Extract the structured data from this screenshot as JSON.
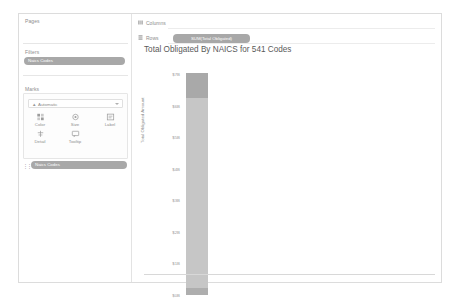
{
  "app": {
    "type": "tableau-worksheet"
  },
  "sidebar": {
    "pages": {
      "label": "Pages"
    },
    "filters": {
      "label": "Filters",
      "pills": [
        {
          "label": "Naics Codes"
        }
      ]
    },
    "marks": {
      "label": "Marks",
      "mark_type": {
        "value": "Automatic",
        "icon": "mark-type-icon",
        "caret": "chevron-down-icon"
      },
      "buttons": [
        {
          "label": "Color",
          "icon": "color-icon"
        },
        {
          "label": "Size",
          "icon": "size-icon"
        },
        {
          "label": "Label",
          "icon": "label-icon"
        },
        {
          "label": "Detail",
          "icon": "detail-icon"
        },
        {
          "label": "Tooltip",
          "icon": "tooltip-icon"
        }
      ],
      "pills": [
        {
          "label": "Naics Codes",
          "grip": "grip-icon"
        }
      ]
    }
  },
  "shelves": {
    "columns": {
      "label": "Columns",
      "icon": "columns-icon",
      "pills": []
    },
    "rows": {
      "label": "Rows",
      "icon": "rows-icon",
      "pills": [
        {
          "label": "SUM(Total Obligated)"
        }
      ]
    }
  },
  "chart_data": {
    "type": "bar",
    "title": "Total Obligated By NAICS for 541 Codes",
    "xlabel": "",
    "ylabel": "Total Obligated Amount",
    "grid": false,
    "legend": null,
    "categories": [
      "Naics Codes"
    ],
    "ytick_labels": [
      "$0B",
      "$1B",
      "$2B",
      "$3B",
      "$4B",
      "$5B",
      "$6B",
      "$7B"
    ],
    "ytick_values": [
      0,
      1,
      2,
      3,
      4,
      5,
      6,
      7
    ],
    "ylim": [
      0,
      7.4
    ],
    "series": [
      {
        "name": "SUM(Total Obligated)",
        "values": [
          7.05
        ],
        "color": "#c4c4c4"
      }
    ],
    "stack_segments": [
      {
        "name": "top-segment",
        "from": 6.25,
        "to": 7.05,
        "color": "#a9a9a9"
      },
      {
        "name": "body-segment",
        "from": 0.22,
        "to": 6.25,
        "color": "#c6c6c6"
      },
      {
        "name": "bottom-segment",
        "from": 0.0,
        "to": 0.22,
        "color": "#aeaeae"
      }
    ]
  },
  "colors": {
    "panel_border": "#dcdcdc",
    "pill": "#a8a8a8",
    "bar": "#c6c6c6",
    "bar_dark": "#a9a9a9",
    "text": "#8d8d8d"
  }
}
